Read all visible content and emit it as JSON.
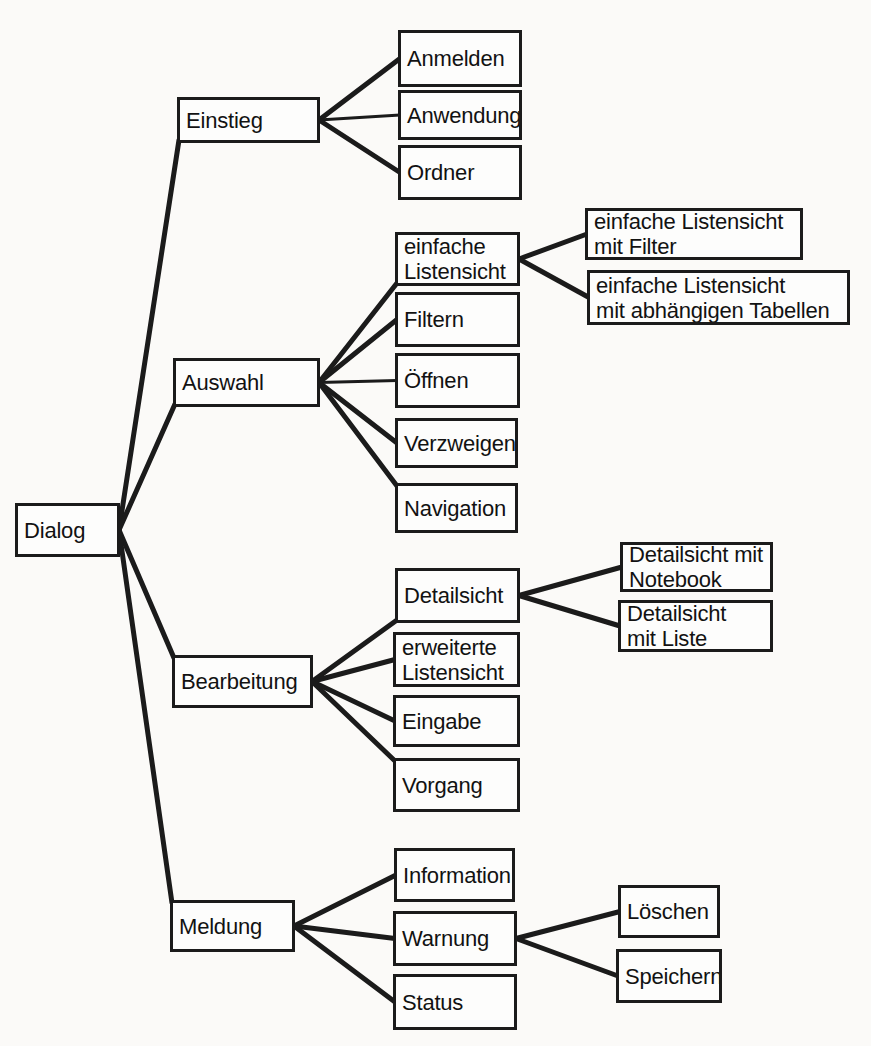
{
  "diagram": {
    "background_color": "#fbfaf8",
    "box_fill_color": "#fdfdfc",
    "box_border_color": "#1b1b1b",
    "line_color": "#1b1b1b",
    "text_color": "#121212"
  },
  "nodes": [
    {
      "id": "dialog",
      "label": "Dialog",
      "x": 15,
      "y": 503,
      "w": 105,
      "h": 54,
      "level": 1
    },
    {
      "id": "einstieg",
      "label": "Einstieg",
      "x": 177,
      "y": 97,
      "w": 143,
      "h": 46,
      "level": 2
    },
    {
      "id": "anmelden",
      "label": "Anmelden",
      "x": 398,
      "y": 30,
      "w": 124,
      "h": 57,
      "level": 3
    },
    {
      "id": "anwendung",
      "label": "Anwendung",
      "x": 398,
      "y": 90,
      "w": 124,
      "h": 50,
      "level": 3
    },
    {
      "id": "ordner",
      "label": "Ordner",
      "x": 398,
      "y": 145,
      "w": 124,
      "h": 55,
      "level": 3
    },
    {
      "id": "auswahl",
      "label": "Auswahl",
      "x": 173,
      "y": 358,
      "w": 147,
      "h": 49,
      "level": 2
    },
    {
      "id": "einfache-listensicht",
      "label": "einfache\nListensicht",
      "x": 395,
      "y": 232,
      "w": 125,
      "h": 54,
      "level": 3
    },
    {
      "id": "listensicht-mit-filter",
      "label": "einfache Listensicht\nmit Filter",
      "x": 585,
      "y": 208,
      "w": 218,
      "h": 52,
      "level": 4
    },
    {
      "id": "listensicht-mit-abhaengigen-tabellen",
      "label": "einfache Listensicht\nmit abhängigen Tabellen",
      "x": 587,
      "y": 270,
      "w": 263,
      "h": 55,
      "level": 4
    },
    {
      "id": "filtern",
      "label": "Filtern",
      "x": 395,
      "y": 292,
      "w": 125,
      "h": 55,
      "level": 3
    },
    {
      "id": "oeffnen",
      "label": "Öffnen",
      "x": 395,
      "y": 353,
      "w": 125,
      "h": 55,
      "level": 3
    },
    {
      "id": "verzweigen",
      "label": "Verzweigen",
      "x": 395,
      "y": 418,
      "w": 123,
      "h": 50,
      "level": 3
    },
    {
      "id": "navigation",
      "label": "Navigation",
      "x": 395,
      "y": 483,
      "w": 123,
      "h": 50,
      "level": 3
    },
    {
      "id": "bearbeitung",
      "label": "Bearbeitung",
      "x": 172,
      "y": 655,
      "w": 141,
      "h": 53,
      "level": 2
    },
    {
      "id": "detailsicht",
      "label": "Detailsicht",
      "x": 395,
      "y": 568,
      "w": 125,
      "h": 55,
      "level": 3
    },
    {
      "id": "detailsicht-mit-notebook",
      "label": "Detailsicht mit\nNotebook",
      "x": 620,
      "y": 542,
      "w": 153,
      "h": 50,
      "level": 4
    },
    {
      "id": "detailsicht-mit-liste",
      "label": "Detailsicht\nmit Liste",
      "x": 618,
      "y": 600,
      "w": 155,
      "h": 52,
      "level": 4
    },
    {
      "id": "erweiterte-listensicht",
      "label": "erweiterte\nListensicht",
      "x": 393,
      "y": 632,
      "w": 127,
      "h": 55,
      "level": 3
    },
    {
      "id": "eingabe",
      "label": "Eingabe",
      "x": 393,
      "y": 695,
      "w": 127,
      "h": 52,
      "level": 3
    },
    {
      "id": "vorgang",
      "label": "Vorgang",
      "x": 393,
      "y": 758,
      "w": 127,
      "h": 54,
      "level": 3
    },
    {
      "id": "meldung",
      "label": "Meldung",
      "x": 170,
      "y": 900,
      "w": 125,
      "h": 52,
      "level": 2
    },
    {
      "id": "information",
      "label": "Information",
      "x": 394,
      "y": 848,
      "w": 121,
      "h": 54,
      "level": 3
    },
    {
      "id": "warnung",
      "label": "Warnung",
      "x": 393,
      "y": 911,
      "w": 124,
      "h": 55,
      "level": 3
    },
    {
      "id": "status",
      "label": "Status",
      "x": 393,
      "y": 974,
      "w": 124,
      "h": 56,
      "level": 3
    },
    {
      "id": "loeschen",
      "label": "Löschen",
      "x": 618,
      "y": 885,
      "w": 102,
      "h": 53,
      "level": 4
    },
    {
      "id": "speichern",
      "label": "Speichern",
      "x": 616,
      "y": 949,
      "w": 106,
      "h": 54,
      "level": 4
    }
  ],
  "edges": [
    {
      "from": "dialog",
      "to": "einstieg"
    },
    {
      "from": "dialog",
      "to": "auswahl"
    },
    {
      "from": "dialog",
      "to": "bearbeitung"
    },
    {
      "from": "dialog",
      "to": "meldung"
    },
    {
      "from": "einstieg",
      "to": "anmelden"
    },
    {
      "from": "einstieg",
      "to": "anwendung"
    },
    {
      "from": "einstieg",
      "to": "ordner"
    },
    {
      "from": "auswahl",
      "to": "einfache-listensicht"
    },
    {
      "from": "auswahl",
      "to": "filtern"
    },
    {
      "from": "auswahl",
      "to": "oeffnen"
    },
    {
      "from": "auswahl",
      "to": "verzweigen"
    },
    {
      "from": "auswahl",
      "to": "navigation"
    },
    {
      "from": "einfache-listensicht",
      "to": "listensicht-mit-filter"
    },
    {
      "from": "einfache-listensicht",
      "to": "listensicht-mit-abhaengigen-tabellen"
    },
    {
      "from": "bearbeitung",
      "to": "detailsicht"
    },
    {
      "from": "bearbeitung",
      "to": "erweiterte-listensicht"
    },
    {
      "from": "bearbeitung",
      "to": "eingabe"
    },
    {
      "from": "bearbeitung",
      "to": "vorgang"
    },
    {
      "from": "detailsicht",
      "to": "detailsicht-mit-notebook"
    },
    {
      "from": "detailsicht",
      "to": "detailsicht-mit-liste"
    },
    {
      "from": "meldung",
      "to": "information"
    },
    {
      "from": "meldung",
      "to": "warnung"
    },
    {
      "from": "meldung",
      "to": "status"
    },
    {
      "from": "warnung",
      "to": "loeschen"
    },
    {
      "from": "warnung",
      "to": "speichern"
    }
  ]
}
